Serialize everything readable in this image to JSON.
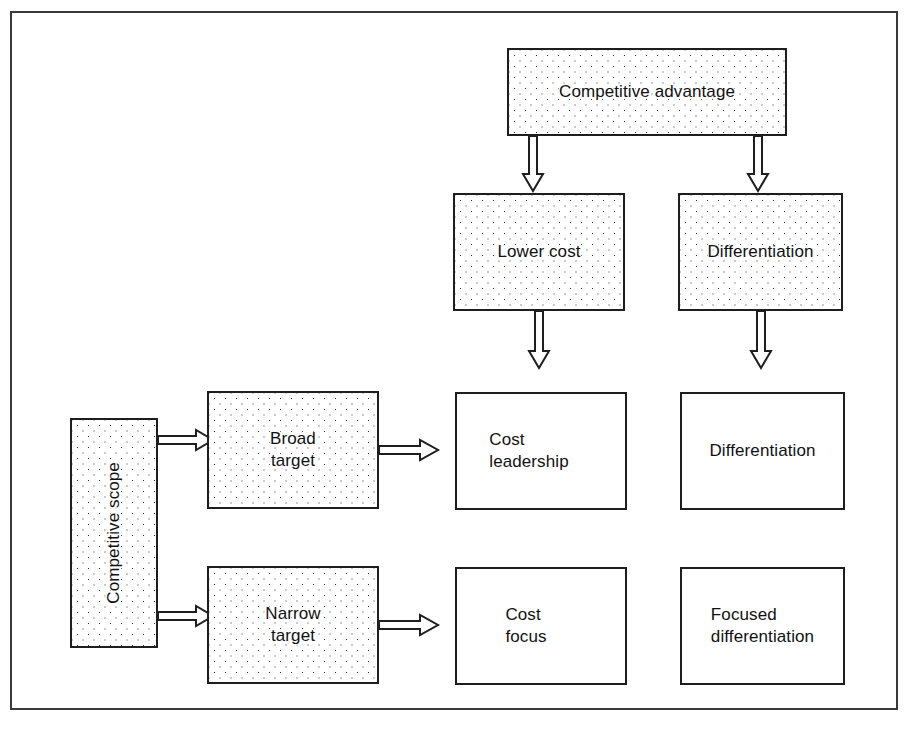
{
  "figure": {
    "frame_color": "#3a3a3a",
    "box_border_color": "#1e1e1e",
    "stipple_dot_color": "#2b2b2b",
    "background_color": "#ffffff"
  },
  "nodes": {
    "competitive_advantage": "Competitive advantage",
    "competitive_scope": "Competitive scope",
    "lower_cost": "Lower cost",
    "differentiation_header": "Differentiation",
    "broad_target": "Broad\ntarget",
    "narrow_target": "Narrow\ntarget",
    "cost_leadership": "Cost\nleadership",
    "differentiation_cell": "Differentiation",
    "cost_focus": "Cost\nfocus",
    "focused_differentiation": "Focused\ndifferentiation"
  },
  "arrows": [
    {
      "name": "competitive-advantage-to-lower-cost",
      "direction": "down"
    },
    {
      "name": "competitive-advantage-to-differentiation",
      "direction": "down"
    },
    {
      "name": "lower-cost-to-cost-leadership",
      "direction": "down"
    },
    {
      "name": "differentiation-to-differentiation-cell",
      "direction": "down"
    },
    {
      "name": "competitive-scope-to-broad-target",
      "direction": "right"
    },
    {
      "name": "competitive-scope-to-narrow-target",
      "direction": "right"
    },
    {
      "name": "broad-target-to-cost-leadership",
      "direction": "right"
    },
    {
      "name": "narrow-target-to-cost-focus",
      "direction": "right"
    }
  ]
}
